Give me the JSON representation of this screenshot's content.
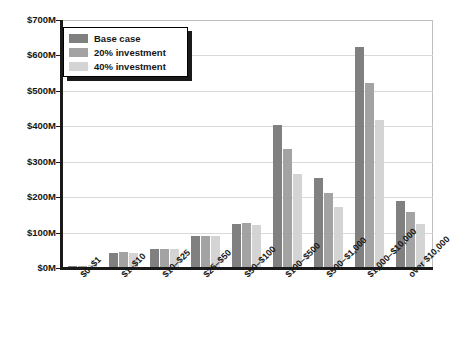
{
  "chart_data": {
    "type": "bar",
    "title": "",
    "xlabel": "",
    "ylabel": "",
    "ylim": [
      0,
      700
    ],
    "grid": true,
    "legend_position": "top-left",
    "y_unit": "M",
    "y_ticks": [
      "$0M",
      "$100M",
      "$200M",
      "$300M",
      "$400M",
      "$500M",
      "$600M",
      "$700M"
    ],
    "y_tick_values": [
      0,
      100,
      200,
      300,
      400,
      500,
      600,
      700
    ],
    "categories": [
      "$0–$1",
      "$1–$10",
      "$10–$25",
      "$25–$50",
      "$50–$100",
      "$100–$500",
      "$500–$1,000",
      "$1,000–$10,000",
      "over $10,000"
    ],
    "series": [
      {
        "name": "Base case",
        "color": "#808080",
        "values": [
          3,
          40,
          52,
          88,
          122,
          400,
          250,
          620,
          185
        ]
      },
      {
        "name": "20% investment",
        "color": "#a3a3a3",
        "values": [
          3,
          42,
          52,
          88,
          124,
          332,
          210,
          520,
          155
        ]
      },
      {
        "name": "40% investment",
        "color": "#d4d4d4",
        "values": [
          6,
          40,
          52,
          88,
          120,
          262,
          168,
          415,
          122
        ]
      }
    ]
  },
  "legend": {
    "items": [
      {
        "label": "Base case",
        "color": "#808080"
      },
      {
        "label": "20% investment",
        "color": "#a3a3a3"
      },
      {
        "label": "40% investment",
        "color": "#d4d4d4"
      }
    ]
  }
}
